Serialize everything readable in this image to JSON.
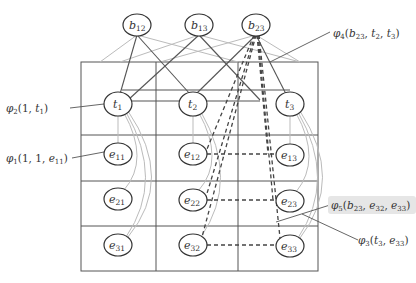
{
  "diagram": {
    "type": "factor-graph-grid",
    "grid": {
      "rows": 4,
      "cols": 3
    },
    "bridge_nodes": [
      {
        "id": "b12",
        "label": "b",
        "sub": "12",
        "x": 137,
        "y": 25
      },
      {
        "id": "b13",
        "label": "b",
        "sub": "13",
        "x": 199,
        "y": 25
      },
      {
        "id": "b23",
        "label": "b",
        "sub": "23",
        "x": 256,
        "y": 25
      }
    ],
    "nodes": [
      {
        "id": "t1",
        "label": "t",
        "sub": "1",
        "x": 118,
        "y": 104
      },
      {
        "id": "t2",
        "label": "t",
        "sub": "2",
        "x": 193,
        "y": 104
      },
      {
        "id": "t3",
        "label": "t",
        "sub": "3",
        "x": 290,
        "y": 104
      },
      {
        "id": "e11",
        "label": "e",
        "sub": "11",
        "x": 118,
        "y": 154
      },
      {
        "id": "e12",
        "label": "e",
        "sub": "12",
        "x": 193,
        "y": 154
      },
      {
        "id": "e13",
        "label": "e",
        "sub": "13",
        "x": 290,
        "y": 155
      },
      {
        "id": "e21",
        "label": "e",
        "sub": "21",
        "x": 118,
        "y": 199
      },
      {
        "id": "e22",
        "label": "e",
        "sub": "22",
        "x": 193,
        "y": 200
      },
      {
        "id": "e23",
        "label": "e",
        "sub": "23",
        "x": 290,
        "y": 201
      },
      {
        "id": "e31",
        "label": "e",
        "sub": "31",
        "x": 118,
        "y": 245
      },
      {
        "id": "e32",
        "label": "e",
        "sub": "32",
        "x": 193,
        "y": 245
      },
      {
        "id": "e33",
        "label": "e",
        "sub": "33",
        "x": 290,
        "y": 246
      }
    ],
    "factor_labels": {
      "phi2": {
        "sym": "φ",
        "sub": "2",
        "args": "(1, t",
        "argsub": "1",
        "tail": ")"
      },
      "phi1": {
        "sym": "φ",
        "sub": "1",
        "args": "(1, 1, e",
        "argsub": "11",
        "tail": ")"
      },
      "phi4": {
        "sym": "φ",
        "sub": "4",
        "text": "(b₂₃, t₂, t₃)"
      },
      "phi5": {
        "sym": "φ",
        "sub": "5",
        "text": "(b₂₃, e₃₂, e₃₃)",
        "highlighted": true
      },
      "phi3": {
        "sym": "φ",
        "sub": "3",
        "text": "(t₃, e₃₃)"
      }
    },
    "colors": {
      "grid": "#555555",
      "node_stroke": "#333333",
      "light_edge": "#bbbbbb",
      "dashed_edge": "#444444",
      "highlight_bg": "#e6e6e6"
    }
  }
}
